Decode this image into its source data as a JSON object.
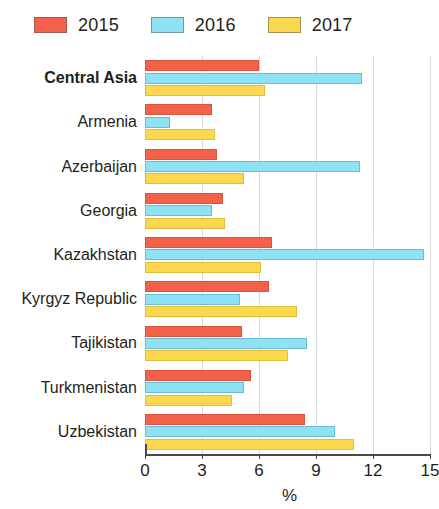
{
  "chart_data": {
    "type": "bar",
    "orientation": "horizontal",
    "title": "",
    "xlabel": "%",
    "ylabel": "",
    "xlim": [
      0,
      15
    ],
    "xticks": [
      0,
      3,
      6,
      9,
      12,
      15
    ],
    "xtick_labels": [
      "0",
      "3",
      "6",
      "9",
      "12",
      "15"
    ],
    "grid": true,
    "grid_axis": "x",
    "legend_position": "top-left",
    "categories": [
      "Central Asia",
      "Armenia",
      "Azerbaijan",
      "Georgia",
      "Kazakhstan",
      "Kyrgyz Republic",
      "Tajikistan",
      "Turkmenistan",
      "Uzbekistan"
    ],
    "emphasized_categories": [
      "Central Asia"
    ],
    "series": [
      {
        "name": "2015",
        "color": "#f4614a",
        "values": [
          6.0,
          3.5,
          3.8,
          4.1,
          6.7,
          6.5,
          5.1,
          5.6,
          8.4
        ]
      },
      {
        "name": "2016",
        "color": "#8fe1f4",
        "values": [
          11.4,
          1.3,
          11.3,
          3.5,
          14.7,
          5.0,
          8.5,
          5.2,
          10.0
        ]
      },
      {
        "name": "2017",
        "color": "#fbd84e",
        "values": [
          6.3,
          3.7,
          5.2,
          4.2,
          6.1,
          8.0,
          7.5,
          4.6,
          11.0
        ]
      }
    ]
  },
  "legend": {
    "items": [
      {
        "label": "2015",
        "color": "#f4614a"
      },
      {
        "label": "2016",
        "color": "#8fe1f4"
      },
      {
        "label": "2017",
        "color": "#fbd84e"
      }
    ]
  }
}
